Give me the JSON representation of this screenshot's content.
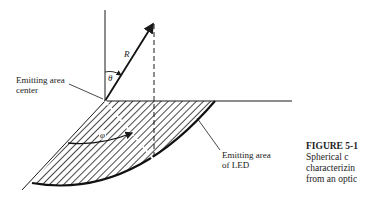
{
  "figure": {
    "number_label": "FIGURE 5-1",
    "caption_lines": [
      "Spherical c",
      "characterizin",
      "from an optic"
    ]
  },
  "labels": {
    "emitting_area_center": [
      "Emitting area",
      "center"
    ],
    "emitting_area_led": [
      "Emitting area",
      "of LED"
    ]
  },
  "symbols": {
    "radius": "R",
    "polar_angle": "θ",
    "azimuth_angle": "φ"
  }
}
